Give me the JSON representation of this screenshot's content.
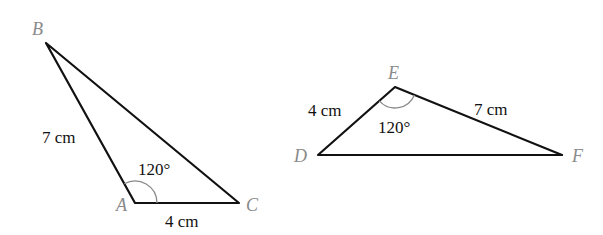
{
  "triangles": [
    {
      "name": "ABC",
      "vertices": {
        "A": "A",
        "B": "B",
        "C": "C"
      },
      "sides": {
        "AB": "7 cm",
        "AC": "4 cm"
      },
      "angle": {
        "vertex": "A",
        "value": "120°"
      }
    },
    {
      "name": "DEF",
      "vertices": {
        "D": "D",
        "E": "E",
        "F": "F"
      },
      "sides": {
        "DE": "4 cm",
        "EF": "7 cm"
      },
      "angle": {
        "vertex": "E",
        "value": "120°"
      }
    }
  ],
  "colors": {
    "edge": "#111111",
    "vertex_label": "#8a8a8a",
    "angle_arc": "#8a8a8a"
  }
}
